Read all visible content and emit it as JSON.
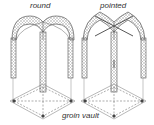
{
  "diagram": {
    "title": "groin vault",
    "vaults": [
      {
        "label": "round",
        "arch_type": "round"
      },
      {
        "label": "pointed",
        "arch_type": "pointed"
      }
    ],
    "colors": {
      "line": "#555555",
      "mesh": "#888888",
      "dash": "#777777",
      "node": "#444444"
    }
  }
}
